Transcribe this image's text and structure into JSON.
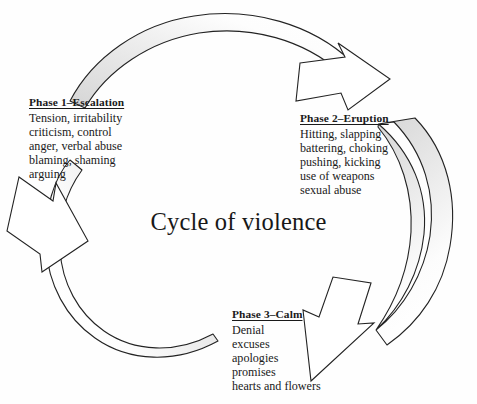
{
  "diagram": {
    "title": "Cycle of violence",
    "shape": "circular-cycle",
    "ring": {
      "center_x": 236,
      "center_y": 202,
      "outer_radius": 186,
      "inner_radius": 150,
      "band_fill": "#e0e0e0",
      "band_stroke": "#232323",
      "arrowhead_fill": "#ffffff"
    },
    "phases": [
      {
        "id": "phase-1",
        "title": "Phase 1–Escalation",
        "lines": [
          "Tension, irritability",
          "criticism, control",
          "anger, verbal abuse",
          "blaming, shaming",
          "arguing"
        ]
      },
      {
        "id": "phase-2",
        "title": "Phase 2–Eruption",
        "lines": [
          "Hitting, slapping",
          "battering, choking",
          "pushing, kicking",
          "use of weapons",
          "sexual abuse"
        ]
      },
      {
        "id": "phase-3",
        "title": "Phase 3–Calm",
        "lines": [
          "Denial",
          "excuses",
          "apologies",
          "promises",
          "hearts and flowers"
        ]
      }
    ],
    "arrows": [
      {
        "name": "escalation-to-eruption-arrow",
        "from": "Phase 1–Escalation",
        "to": "Phase 2–Eruption",
        "direction": "clockwise-top"
      },
      {
        "name": "eruption-to-calm-arrow",
        "from": "Phase 2–Eruption",
        "to": "Phase 3–Calm",
        "direction": "clockwise-right"
      },
      {
        "name": "calm-to-escalation-arrow",
        "from": "Phase 3–Calm",
        "to": "Phase 1–Escalation",
        "direction": "clockwise-bottom-left"
      }
    ]
  }
}
